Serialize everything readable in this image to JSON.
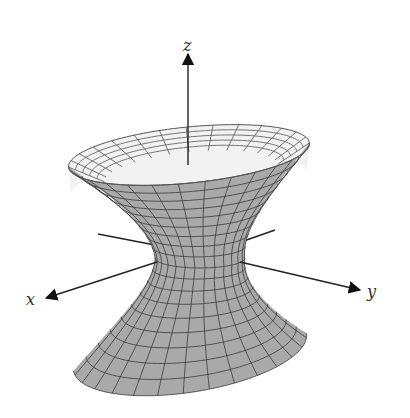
{
  "figure": {
    "surface": "hyperboloid-of-one-sheet",
    "colors": {
      "background": "#ffffff",
      "outer_surface": "#a9a9a9",
      "inner_surface": "#f2f2f2",
      "grid_lines": "#3a3a3a",
      "axes": "#222222"
    },
    "axes": {
      "x": {
        "label": "x"
      },
      "y": {
        "label": "y"
      },
      "z": {
        "label": "z"
      }
    }
  }
}
